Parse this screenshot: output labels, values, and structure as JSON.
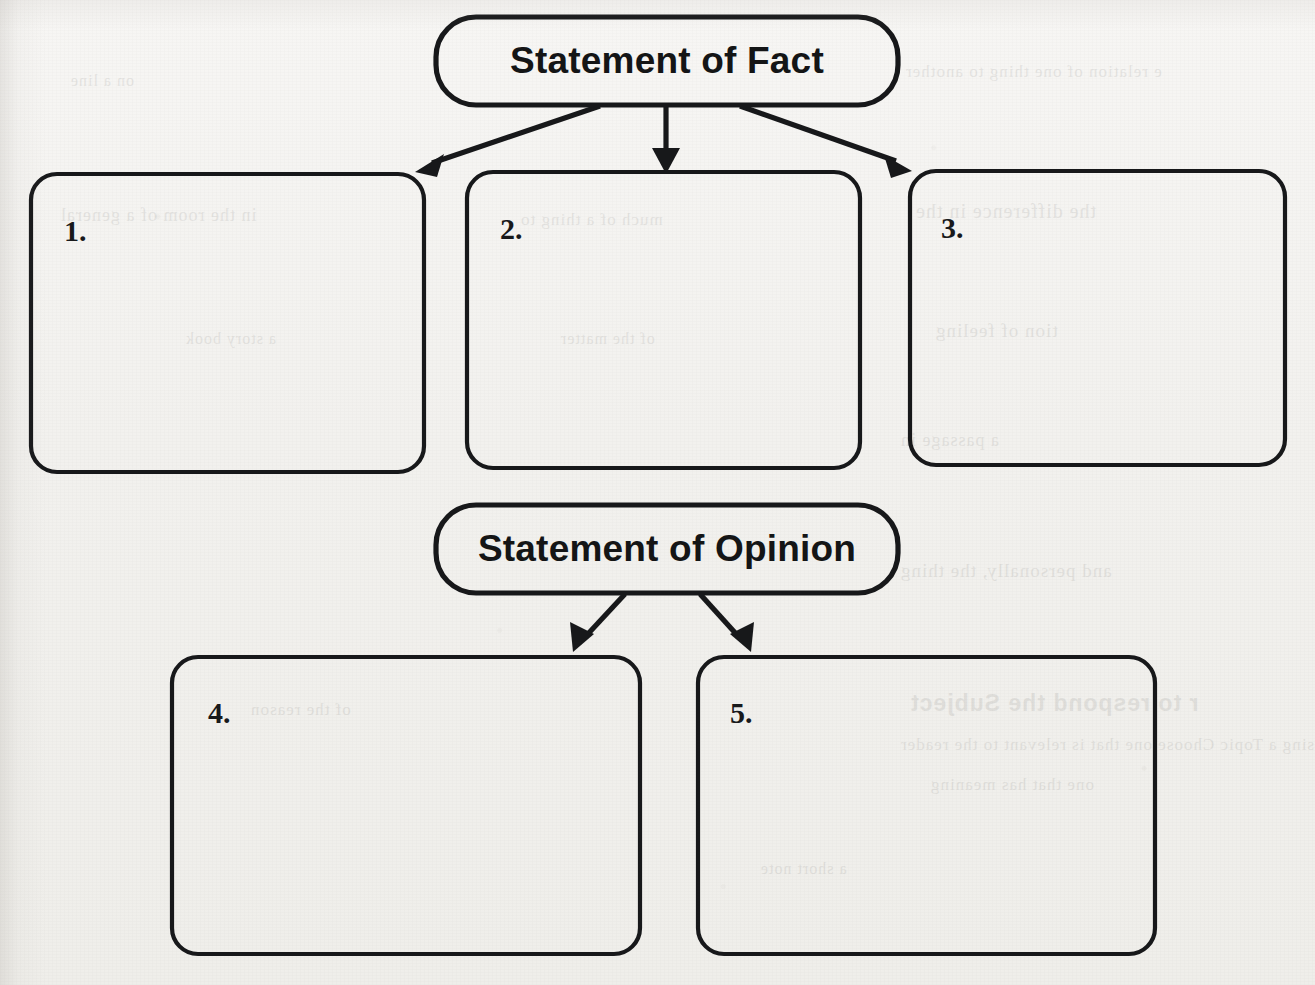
{
  "worksheet": {
    "width": 1315,
    "height": 985,
    "ink_color": "#17181a",
    "paper_color": "#f4f3f1"
  },
  "headers": [
    {
      "id": "statement-of-fact",
      "label": "Statement of Fact",
      "x": 436,
      "y": 17,
      "width": 462,
      "height": 88,
      "radius": 40,
      "center_x": 667,
      "center_y": 61
    },
    {
      "id": "statement-of-opinion",
      "label": "Statement of Opinion",
      "x": 436,
      "y": 505,
      "width": 462,
      "height": 88,
      "radius": 40,
      "center_x": 667,
      "center_y": 549
    }
  ],
  "answer_boxes": [
    {
      "id": "box-1",
      "number": "1.",
      "group": "fact",
      "x": 31,
      "y": 174,
      "width": 393,
      "height": 298,
      "radius": 26,
      "label_x": 64,
      "label_y": 216
    },
    {
      "id": "box-2",
      "number": "2.",
      "group": "fact",
      "x": 467,
      "y": 172,
      "width": 393,
      "height": 296,
      "radius": 26,
      "label_x": 500,
      "label_y": 214
    },
    {
      "id": "box-3",
      "number": "3.",
      "group": "fact",
      "x": 910,
      "y": 171,
      "width": 375,
      "height": 294,
      "radius": 26,
      "label_x": 941,
      "label_y": 213
    },
    {
      "id": "box-4",
      "number": "4.",
      "group": "opinion",
      "x": 172,
      "y": 657,
      "width": 468,
      "height": 297,
      "radius": 26,
      "label_x": 208,
      "label_y": 698
    },
    {
      "id": "box-5",
      "number": "5.",
      "group": "opinion",
      "x": 698,
      "y": 657,
      "width": 457,
      "height": 297,
      "radius": 26,
      "label_x": 730,
      "label_y": 698
    }
  ],
  "connectors": [
    {
      "id": "fact-to-1",
      "from": "statement-of-fact",
      "to": "box-1",
      "x1": 600,
      "y1": 106,
      "x2": 424,
      "y2": 166,
      "direction": "down-left"
    },
    {
      "id": "fact-to-2",
      "from": "statement-of-fact",
      "to": "box-2",
      "x1": 666,
      "y1": 106,
      "x2": 666,
      "y2": 166,
      "direction": "down"
    },
    {
      "id": "fact-to-3",
      "from": "statement-of-fact",
      "to": "box-3",
      "x1": 740,
      "y1": 106,
      "x2": 903,
      "y2": 164,
      "direction": "down-right"
    },
    {
      "id": "opinion-to-4",
      "from": "statement-of-opinion",
      "to": "box-4",
      "x1": 625,
      "y1": 594,
      "x2": 575,
      "y2": 648,
      "direction": "down-left"
    },
    {
      "id": "opinion-to-5",
      "from": "statement-of-opinion",
      "to": "box-5",
      "x1": 700,
      "y1": 594,
      "x2": 748,
      "y2": 648,
      "direction": "down-right"
    }
  ]
}
